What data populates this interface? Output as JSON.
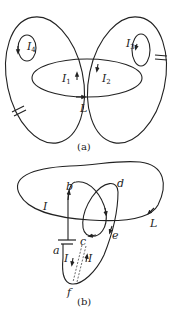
{
  "figure_a": {
    "caption": "(a)",
    "labels": {
      "I1": "I",
      "I1_sub": "1",
      "I2": "I",
      "I2_sub": "2",
      "I3": "I",
      "I3_sub": "3",
      "I4": "I",
      "I4_sub": "4",
      "L": "L"
    }
  },
  "figure_b": {
    "caption": "(b)",
    "labels": {
      "I_outer": "I",
      "L": "L",
      "a": "a",
      "b": "b",
      "c": "c",
      "d": "d",
      "e": "e",
      "f": "f",
      "I_left": "I",
      "I_right": "I"
    }
  },
  "colors": {
    "stroke": "#222222",
    "background": "#ffffff"
  }
}
